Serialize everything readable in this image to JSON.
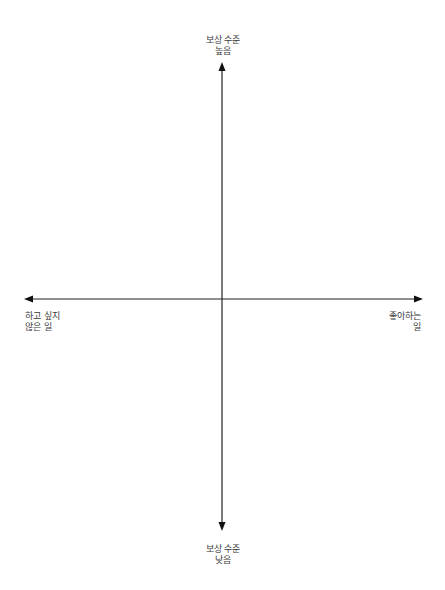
{
  "diagram": {
    "type": "quadrant-axes",
    "axes": {
      "vertical": {
        "top_label": [
          "보상 수준",
          "높음"
        ],
        "bottom_label": [
          "보상 수준",
          "낮음"
        ]
      },
      "horizontal": {
        "left_label": [
          "하고 싶지",
          "않은 일"
        ],
        "right_label": [
          "좋아하는",
          "일"
        ]
      }
    },
    "colors": {
      "axis": "#222222",
      "text": "#3a3a3a",
      "background": "#ffffff"
    }
  }
}
